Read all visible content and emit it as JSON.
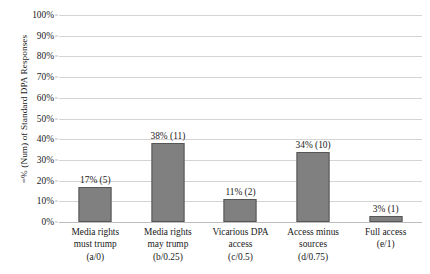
{
  "chart_data": {
    "type": "bar",
    "title": "",
    "xlabel": "",
    "ylabel": "=% (Num) of Standard DPA Responses",
    "ylim": [
      0,
      100
    ],
    "ytick_labels": [
      "100%",
      "90%",
      "80%",
      "70%",
      "60%",
      "50%",
      "40%",
      "30%",
      "20%",
      "10%",
      "0%"
    ],
    "ytick_values": [
      100,
      90,
      80,
      70,
      60,
      50,
      40,
      30,
      20,
      10,
      0
    ],
    "grid": true,
    "legend": "none",
    "bar_color": "#808080",
    "bar_border_color": "#565656",
    "gridline_color": "#d4d4d4",
    "categories": [
      [
        "Media rights",
        "must trump",
        "(a/0)"
      ],
      [
        "Media rights",
        "may trump",
        "(b/0.25)"
      ],
      [
        "Vicarious DPA",
        "access",
        "(c/0.5)"
      ],
      [
        "Access minus",
        "sources",
        "(d/0.75)"
      ],
      [
        "Full access",
        "(e/1)"
      ]
    ],
    "values": [
      17,
      38,
      11,
      34,
      3
    ],
    "counts": [
      5,
      11,
      2,
      10,
      1
    ],
    "data_labels": [
      "17% (5)",
      "38% (11)",
      "11% (2)",
      "34% (10)",
      "3% (1)"
    ]
  }
}
